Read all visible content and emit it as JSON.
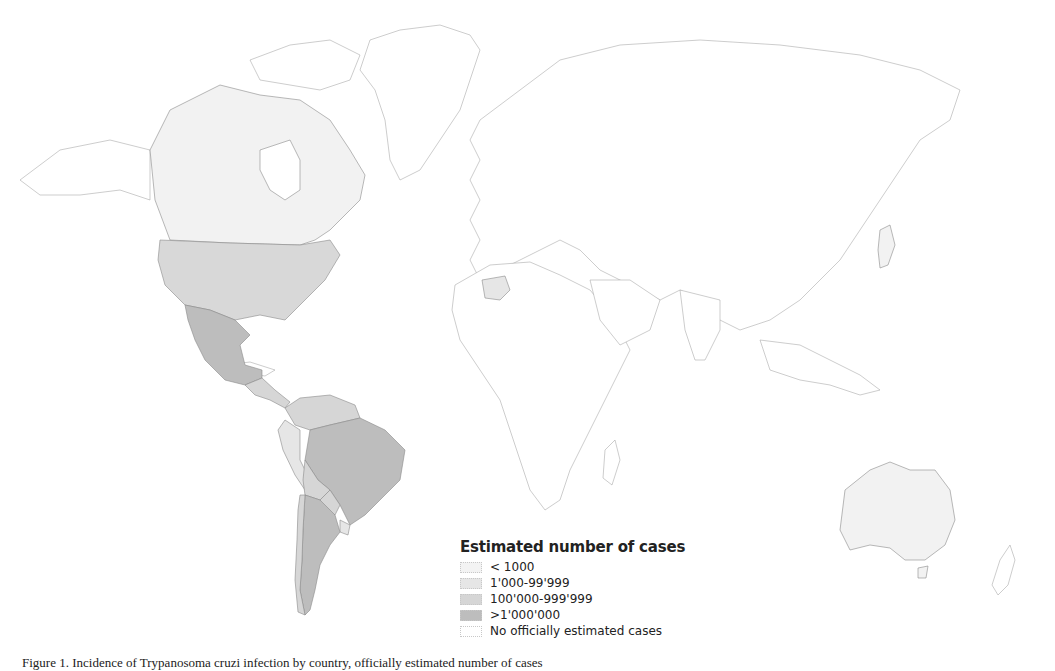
{
  "map": {
    "title": "Estimated number of cases",
    "legend": [
      {
        "label": "< 1000",
        "color": "#f3f3f3"
      },
      {
        "label": "1'000-99'999",
        "color": "#e6e6e6"
      },
      {
        "label": "100'000-999'999",
        "color": "#d6d6d6"
      },
      {
        "label": ">1'000'000",
        "color": "#bdbdbd"
      },
      {
        "label": "No officially estimated cases",
        "color": "#ffffff"
      }
    ],
    "regions": [
      {
        "name": "Canada",
        "category": "< 1000"
      },
      {
        "name": "United States",
        "category": "100'000-999'999"
      },
      {
        "name": "Mexico",
        "category": ">1'000'000"
      },
      {
        "name": "Central America",
        "category": "100'000-999'999"
      },
      {
        "name": "Colombia/Venezuela",
        "category": "100'000-999'999"
      },
      {
        "name": "Peru/Ecuador",
        "category": "1'000-99'999"
      },
      {
        "name": "Bolivia",
        "category": "100'000-999'999"
      },
      {
        "name": "Brazil",
        "category": ">1'000'000"
      },
      {
        "name": "Argentina",
        "category": ">1'000'000"
      },
      {
        "name": "Chile",
        "category": "100'000-999'999"
      },
      {
        "name": "Uruguay",
        "category": "1'000-99'999"
      },
      {
        "name": "Paraguay",
        "category": "100'000-999'999"
      },
      {
        "name": "Spain",
        "category": "1'000-99'999"
      },
      {
        "name": "Japan",
        "category": "< 1000"
      },
      {
        "name": "Australia",
        "category": "< 1000"
      }
    ]
  },
  "caption": "Figure 1. Incidence of Trypanosoma cruzi infection by country, officially estimated number of cases"
}
